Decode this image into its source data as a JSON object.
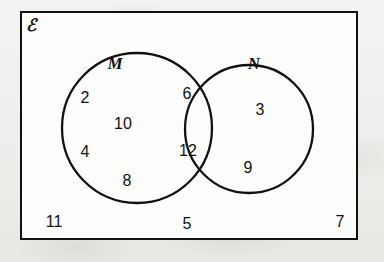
{
  "diagram": {
    "type": "venn-2-set",
    "universe_symbol": "ℰ",
    "universe_symbol_name": "script-capital-E",
    "border_color": "#111111",
    "background_color": "#f2f1ef",
    "sets": [
      {
        "id": "M",
        "label": "M"
      },
      {
        "id": "N",
        "label": "N"
      }
    ],
    "regions": {
      "m_only": {
        "name": "M only",
        "values": [
          "2",
          "10",
          "4",
          "8"
        ]
      },
      "intersection": {
        "name": "M and N",
        "values": [
          "6",
          "12"
        ]
      },
      "n_only": {
        "name": "N only",
        "values": [
          "3",
          "9"
        ]
      },
      "outside": {
        "name": "Outside both sets",
        "values": [
          "11",
          "5",
          "7"
        ]
      }
    },
    "elements": [
      {
        "text": "2",
        "region": "m_only",
        "x": 85,
        "y": 98
      },
      {
        "text": "10",
        "region": "m_only",
        "x": 123,
        "y": 124
      },
      {
        "text": "4",
        "region": "m_only",
        "x": 85,
        "y": 152
      },
      {
        "text": "8",
        "region": "m_only",
        "x": 127,
        "y": 181
      },
      {
        "text": "6",
        "region": "intersection",
        "x": 187,
        "y": 94
      },
      {
        "text": "12",
        "region": "intersection",
        "x": 188,
        "y": 151
      },
      {
        "text": "3",
        "region": "n_only",
        "x": 260,
        "y": 110
      },
      {
        "text": "9",
        "region": "n_only",
        "x": 248,
        "y": 168
      },
      {
        "text": "11",
        "region": "outside",
        "x": 54,
        "y": 222
      },
      {
        "text": "5",
        "region": "outside",
        "x": 187,
        "y": 224
      },
      {
        "text": "7",
        "region": "outside",
        "x": 340,
        "y": 222
      }
    ],
    "set_labels": [
      {
        "text": "M",
        "x": 115,
        "y": 63
      },
      {
        "text": "N",
        "x": 254,
        "y": 63
      }
    ],
    "geometry": {
      "rect": {
        "x": 20,
        "y": 11,
        "width": 338,
        "height": 229
      },
      "circle_m": {
        "cx": 137,
        "cy": 128,
        "r": 75
      },
      "circle_n": {
        "cx": 249,
        "cy": 129,
        "r": 64
      }
    }
  }
}
